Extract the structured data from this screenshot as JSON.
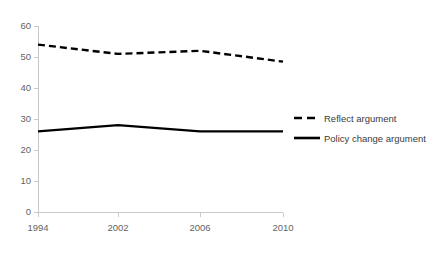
{
  "chart_data": {
    "type": "line",
    "title": "",
    "xlabel": "",
    "ylabel": "",
    "categories": [
      "1994",
      "2002",
      "2006",
      "2010"
    ],
    "category_positions": [
      0,
      80,
      162,
      245
    ],
    "ylim": [
      0,
      60
    ],
    "yticks": [
      0,
      10,
      20,
      30,
      40,
      50,
      60
    ],
    "ytick_labels": [
      "0",
      "10",
      "20",
      "30",
      "40",
      "50",
      "60"
    ],
    "grid": false,
    "legend_position": "right",
    "series": [
      {
        "name": "Reflect argument",
        "values": [
          54,
          51,
          52,
          48.5
        ],
        "style": "dashed",
        "color": "#000000"
      },
      {
        "name": "Policy change argument",
        "values": [
          26,
          28,
          26,
          26
        ],
        "style": "solid",
        "color": "#000000"
      }
    ]
  },
  "legend": {
    "items": [
      {
        "label": "Reflect argument",
        "style": "dashed"
      },
      {
        "label": "Policy change argument",
        "style": "solid"
      }
    ]
  },
  "axes": {
    "y_labels": [
      "60",
      "50",
      "40",
      "30",
      "20",
      "10",
      "0"
    ],
    "x_labels": [
      "1994",
      "2002",
      "2006",
      "2010"
    ]
  },
  "colors": {
    "series": "#000000",
    "axis": "#c9c9c9",
    "tick_text": "#636363",
    "legend_text": "#3b3b3b",
    "background": "#ffffff"
  }
}
